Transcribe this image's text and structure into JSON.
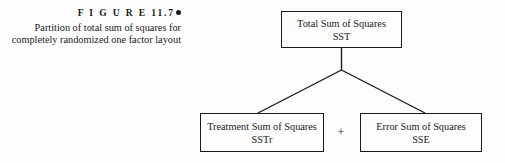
{
  "figure": {
    "label": "F I G U R E   11.7",
    "bullet_icon": "filled-circle-bullet",
    "caption_line_1": "Partition of total sum of squares for",
    "caption_line_2": "completely randomized one factor layout"
  },
  "diagram": {
    "type": "tree",
    "line_color": "#1a1a1a",
    "background_color": "#fdfdfd",
    "parent": {
      "title": "Total Sum of Squares",
      "abbr": "SST"
    },
    "children": [
      {
        "title": "Treatment Sum of Squares",
        "abbr": "SSTr"
      },
      {
        "title": "Error Sum of Squares",
        "abbr": "SSE"
      }
    ],
    "operator": "+"
  }
}
